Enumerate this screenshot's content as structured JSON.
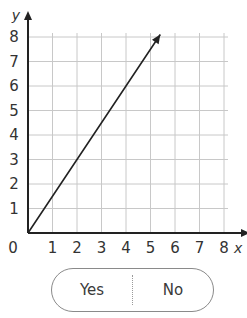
{
  "chart_data": {
    "type": "line",
    "title": "",
    "xlabel": "x",
    "ylabel": "y",
    "xlim": [
      0,
      8
    ],
    "ylim": [
      0,
      8
    ],
    "x_ticks": [
      1,
      2,
      3,
      4,
      5,
      6,
      7,
      8
    ],
    "y_ticks": [
      1,
      2,
      3,
      4,
      5,
      6,
      7,
      8
    ],
    "origin_label": "0",
    "grid": true,
    "series": [
      {
        "name": "line",
        "x": [
          0,
          2,
          4,
          5.4
        ],
        "y": [
          0,
          3,
          6,
          8.1
        ],
        "equation": "y = 1.5x",
        "arrow_end": true
      }
    ]
  },
  "answer_toggle": {
    "yes_label": "Yes",
    "no_label": "No"
  },
  "colors": {
    "grid": "#c8c8c8",
    "axis": "#222222",
    "line": "#222222",
    "text": "#333333",
    "pill_border": "#8a8a8a"
  }
}
